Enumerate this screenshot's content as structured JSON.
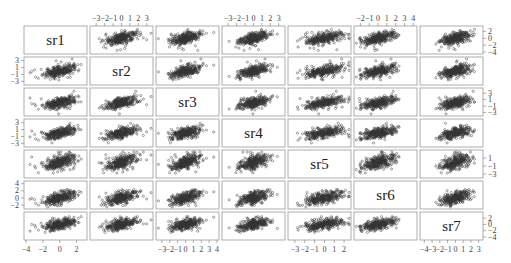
{
  "chart_data": {
    "type": "scatter",
    "subtype": "scatterplot-matrix",
    "title": "",
    "variables": [
      "sr1",
      "sr2",
      "sr3",
      "sr4",
      "sr5",
      "sr6",
      "sr7"
    ],
    "n_points_per_panel_approx": 300,
    "correlation_hint": "moderate positive correlation in all off-diagonal panels",
    "axes": {
      "top": [
        {
          "column": "sr2",
          "ticks": [
            "-3",
            "-2",
            "-1",
            "0",
            "1",
            "2",
            "3"
          ]
        },
        {
          "column": "sr4",
          "ticks": [
            "-3",
            "-2",
            "-1",
            "0",
            "1",
            "2",
            "3"
          ]
        },
        {
          "column": "sr6",
          "ticks": [
            "-2",
            "-1",
            "0",
            "1",
            "2",
            "3",
            "4"
          ]
        }
      ],
      "bottom": [
        {
          "column": "sr1",
          "ticks": [
            "-4",
            "-2",
            "0",
            "2"
          ]
        },
        {
          "column": "sr3",
          "ticks": [
            "-3",
            "-2",
            "-1",
            "0",
            "1",
            "2",
            "3",
            "4"
          ]
        },
        {
          "column": "sr5",
          "ticks": [
            "-3",
            "-2",
            "-1",
            "0",
            "1",
            "2"
          ]
        },
        {
          "column": "sr7",
          "ticks": [
            "-4",
            "-3",
            "-2",
            "-1",
            "0",
            "1",
            "2",
            "3"
          ]
        }
      ],
      "left": [
        {
          "row": "sr2",
          "ticks": [
            "3",
            "1",
            "-1",
            "-3"
          ]
        },
        {
          "row": "sr4",
          "ticks": [
            "3",
            "1",
            "-1",
            "-3"
          ]
        },
        {
          "row": "sr6",
          "ticks": [
            "4",
            "2",
            "0",
            "-2"
          ]
        }
      ],
      "right": [
        {
          "row": "sr1",
          "ticks": [
            "2",
            "0",
            "-2",
            "-4"
          ]
        },
        {
          "row": "sr3",
          "ticks": [
            "3",
            "1",
            "-1",
            "-3"
          ]
        },
        {
          "row": "sr5",
          "ticks": [
            "1",
            "-1",
            "-3"
          ]
        },
        {
          "row": "sr7",
          "ticks": [
            "2",
            "0",
            "-2",
            "-4"
          ]
        }
      ]
    },
    "ranges": {
      "sr1": [
        -4,
        3
      ],
      "sr2": [
        -3.5,
        3.5
      ],
      "sr3": [
        -3.5,
        4
      ],
      "sr4": [
        -3.5,
        3.5
      ],
      "sr5": [
        -3.5,
        2.5
      ],
      "sr6": [
        -2.5,
        4.2
      ],
      "sr7": [
        -4.3,
        3.3
      ]
    },
    "grid": false,
    "legend": null,
    "point_style": "open circles, dark gray"
  }
}
